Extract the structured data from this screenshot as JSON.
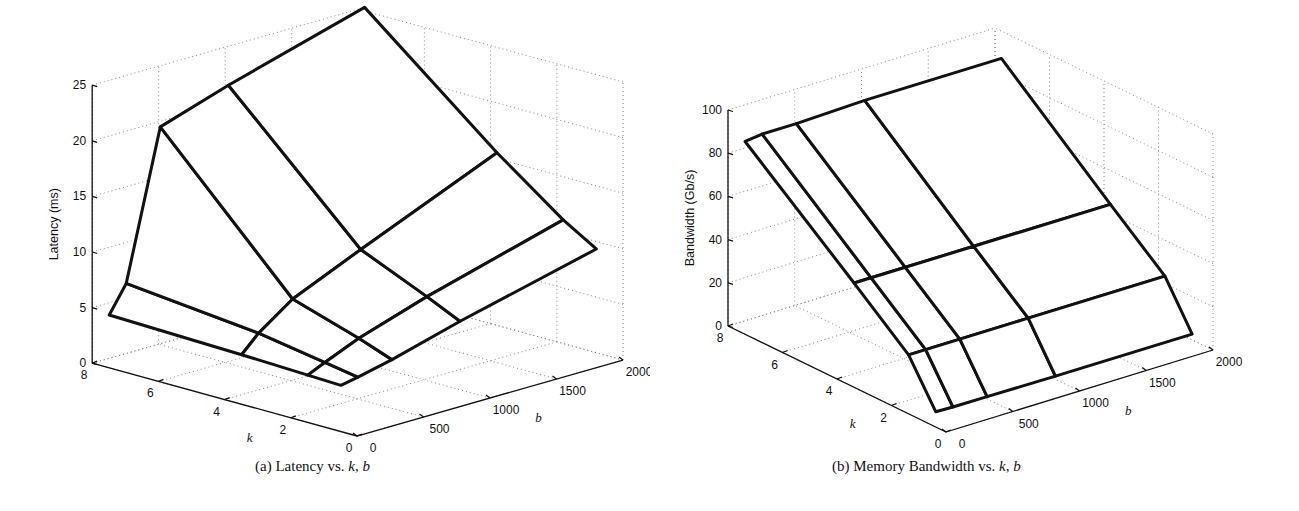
{
  "chart_data": [
    {
      "id": "a",
      "type": "surface3d",
      "title": "",
      "caption": {
        "prefix": "(a) Latency vs. ",
        "var1": "k",
        "sep": ", ",
        "var2": "b"
      },
      "xlabel": "b",
      "ylabel": "k",
      "zlabel": "Latency (ms)",
      "xlim": [
        0,
        2000
      ],
      "ylim": [
        0,
        8
      ],
      "zlim": [
        0,
        25
      ],
      "xticks": [
        0,
        500,
        1000,
        1500,
        2000
      ],
      "yticks": [
        0,
        2,
        4,
        6,
        8
      ],
      "zticks": [
        0,
        5,
        10,
        15,
        20,
        25
      ],
      "grid": true,
      "b_values": [
        128,
        256,
        512,
        1024,
        2048
      ],
      "k_values": [
        1,
        2,
        4,
        8
      ],
      "surface_series": [
        {
          "k": 1,
          "values": [
            3.3,
            3.6,
            4.3,
            6.0,
            9.0
          ]
        },
        {
          "k": 2,
          "values": [
            3.4,
            4.1,
            5.4,
            7.4,
            10.8
          ]
        },
        {
          "k": 4,
          "values": [
            3.6,
            5.1,
            7.3,
            10.0,
            15.2
          ]
        },
        {
          "k": 8,
          "values": [
            3.9,
            6.3,
            19.5,
            21.5,
            25.0
          ]
        }
      ]
    },
    {
      "id": "b",
      "type": "surface3d",
      "title": "",
      "caption": {
        "prefix": "(b) Memory Bandwidth vs. ",
        "var1": "k",
        "sep": ", ",
        "var2": "b"
      },
      "xlabel": "b",
      "ylabel": "k",
      "zlabel": "Bandwidth (Gb/s)",
      "xlim": [
        0,
        2000
      ],
      "ylim": [
        0,
        8
      ],
      "zlim": [
        0,
        100
      ],
      "xticks": [
        0,
        500,
        1000,
        1500,
        2000
      ],
      "yticks": [
        0,
        2,
        4,
        6,
        8
      ],
      "zticks": [
        0,
        20,
        40,
        60,
        80,
        100
      ],
      "grid": true,
      "b_values": [
        128,
        256,
        512,
        1024,
        2048
      ],
      "k_values": [
        1,
        2,
        4,
        8
      ],
      "surface_series": [
        {
          "k": 1,
          "values": [
            0.8,
            0.6,
            0.5,
            0.3,
            0.3
          ]
        },
        {
          "k": 2,
          "values": [
            21,
            21,
            21,
            21,
            21
          ]
        },
        {
          "k": 4,
          "values": [
            42,
            42,
            42,
            42,
            42
          ]
        },
        {
          "k": 8,
          "values": [
            83,
            84,
            84,
            85,
            85
          ]
        }
      ]
    }
  ],
  "projection": {
    "a": {
      "origin": [
        357,
        436
      ],
      "k_unit": [
        -33.1,
        -9.1
      ],
      "b_unit": [
        0.133,
        -0.038
      ],
      "z_unit": -11.12
    },
    "b": {
      "origin": [
        296,
        432
      ],
      "k_unit": [
        -27.25,
        -13.25
      ],
      "b_unit": [
        0.1335,
        -0.041
      ],
      "z_unit": -2.16
    }
  }
}
